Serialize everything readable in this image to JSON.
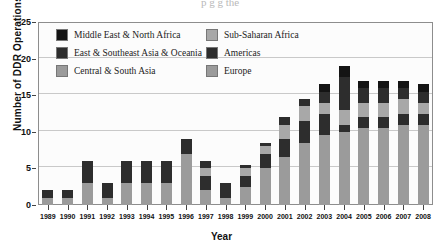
{
  "figure": {
    "cut_title": "p g      g                      the",
    "xtitle": "Year",
    "ytitle": "Number of DDR Operations"
  },
  "legend": {
    "position": "top-left-inside",
    "items": [
      {
        "label": "Middle East & North Africa",
        "color": "#141414"
      },
      {
        "label": "Sub-Saharan Africa",
        "color": "#a8a8a8"
      },
      {
        "label": "East & Southeast Asia & Oceania",
        "color": "#2d2d2d"
      },
      {
        "label": "Americas",
        "color": "#2d2d2d"
      },
      {
        "label": "Central & South Asia",
        "color": "#9b9b9b"
      },
      {
        "label": "Europe",
        "color": "#9b9b9b"
      }
    ]
  },
  "chart_data": {
    "type": "bar",
    "stacked": true,
    "title": "",
    "xlabel": "Year",
    "ylabel": "Number of DDR Operations",
    "ylim": [
      0,
      25
    ],
    "yticks": [
      0,
      5,
      10,
      15,
      20,
      25
    ],
    "grid": true,
    "categories": [
      "1989",
      "1990",
      "1991",
      "1992",
      "1993",
      "1994",
      "1995",
      "1996",
      "1997",
      "1998",
      "1999",
      "2000",
      "2001",
      "2002",
      "2003",
      "2004",
      "2005",
      "2006",
      "2007",
      "2008"
    ],
    "series": [
      {
        "name": "Europe",
        "color": "#9b9b9b",
        "values": [
          0,
          0,
          0,
          0,
          0,
          0,
          0,
          0,
          0,
          0,
          0,
          2.0,
          4.0,
          6.0,
          8.0,
          9.0,
          9.0,
          9.0,
          9.0,
          9.0
        ]
      },
      {
        "name": "Central & South Asia",
        "color": "#9b9b9b",
        "values": [
          1.0,
          1.0,
          3.0,
          1.0,
          3.0,
          3.0,
          3.0,
          7.0,
          2.0,
          1.0,
          2.5,
          3.0,
          2.5,
          2.5,
          1.5,
          1.0,
          1.5,
          1.5,
          2.0,
          2.0
        ]
      },
      {
        "name": "Americas",
        "color": "#2d2d2d",
        "values": [
          1.0,
          1.0,
          3.0,
          2.0,
          3.0,
          3.0,
          3.0,
          2.0,
          2.0,
          2.0,
          1.5,
          2.0,
          2.5,
          3.0,
          3.0,
          1.0,
          1.5,
          1.5,
          1.5,
          1.5
        ]
      },
      {
        "name": "Sub-Saharan Africa",
        "color": "#a8a8a8",
        "values": [
          0,
          0,
          0,
          0,
          0,
          0,
          0,
          0,
          1.0,
          0,
          1.0,
          1.0,
          2.0,
          2.0,
          1.5,
          2.0,
          2.0,
          2.0,
          2.0,
          1.5
        ]
      },
      {
        "name": "East & Southeast Asia & Oceania",
        "color": "#2d2d2d",
        "values": [
          0,
          0,
          0,
          0,
          0,
          0,
          0,
          0,
          1.0,
          0,
          0.5,
          0.5,
          1.0,
          1.0,
          1.5,
          4.5,
          2.0,
          2.0,
          1.5,
          1.5
        ]
      },
      {
        "name": "Middle East & North Africa",
        "color": "#141414",
        "values": [
          0,
          0,
          0,
          0,
          0,
          0,
          0,
          0,
          0,
          0,
          0,
          0,
          0,
          0,
          1.0,
          1.5,
          1.0,
          1.0,
          1.0,
          1.0
        ]
      }
    ],
    "totals": [
      2.0,
      2.0,
      6.0,
      3.0,
      6.0,
      6.0,
      6.0,
      9.0,
      6.0,
      3.0,
      5.5,
      8.5,
      12.0,
      14.5,
      16.5,
      19.0,
      17.0,
      17.0,
      17.0,
      16.5
    ],
    "annotations": []
  }
}
